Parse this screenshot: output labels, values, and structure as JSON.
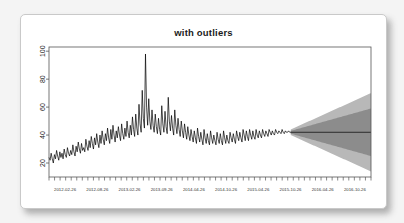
{
  "card": {
    "background": "#ffffff",
    "page_background": "#f4f4f4"
  },
  "chart_data": {
    "type": "line",
    "title": "with outliers",
    "xlabel": "",
    "ylabel": "",
    "ylim": [
      10,
      103
    ],
    "yticks": [
      20,
      40,
      60,
      80,
      100
    ],
    "ytick_labels": [
      "20",
      "40",
      "60",
      "80",
      "100"
    ],
    "grid": false,
    "legend": null,
    "xtick_labels": [
      "2012-02-26",
      "2012-08-26",
      "2013-02-26",
      "2013-09-26",
      "2014-04-26",
      "2014-10-26",
      "2015-04-26",
      "2015-10-26",
      "2016-04-26",
      "2016-10-26"
    ],
    "xtick_minor_count": 58,
    "series": [
      {
        "name": "observed",
        "color": "#000000",
        "x_start": "2012-02-26",
        "x_end": "2015-11-26",
        "values": [
          24,
          22,
          27,
          23,
          20,
          26,
          23,
          29,
          25,
          22,
          28,
          24,
          27,
          23,
          30,
          26,
          24,
          31,
          27,
          25,
          29,
          26,
          33,
          28,
          25,
          32,
          28,
          35,
          30,
          27,
          34,
          29,
          31,
          28,
          37,
          32,
          29,
          36,
          31,
          39,
          34,
          30,
          38,
          33,
          41,
          35,
          31,
          40,
          34,
          43,
          37,
          33,
          41,
          36,
          45,
          38,
          34,
          44,
          37,
          47,
          40,
          35,
          43,
          38,
          46,
          40,
          36,
          48,
          41,
          37,
          45,
          39,
          50,
          42,
          38,
          47,
          40,
          53,
          44,
          39,
          55,
          45,
          40,
          62,
          48,
          42,
          72,
          52,
          45,
          98,
          60,
          47,
          66,
          50,
          44,
          58,
          47,
          42,
          55,
          46,
          41,
          52,
          44,
          40,
          61,
          48,
          42,
          57,
          46,
          41,
          67,
          50,
          43,
          54,
          45,
          40,
          58,
          47,
          41,
          52,
          44,
          39,
          50,
          43,
          38,
          48,
          42,
          37,
          46,
          40,
          36,
          44,
          39,
          35,
          43,
          38,
          34,
          45,
          39,
          35,
          42,
          37,
          33,
          44,
          38,
          34,
          41,
          36,
          33,
          43,
          38,
          34,
          40,
          36,
          33,
          42,
          37,
          34,
          41,
          36,
          33,
          43,
          38,
          34,
          40,
          36,
          34,
          42,
          38,
          35,
          41,
          37,
          34,
          43,
          39,
          36,
          42,
          38,
          35,
          44,
          40,
          36,
          43,
          39,
          36,
          44,
          40,
          37,
          43,
          39,
          37,
          44,
          40,
          38,
          43,
          40,
          38,
          44,
          41,
          39,
          43,
          41,
          39,
          44,
          42,
          40,
          43,
          41,
          40,
          44,
          42,
          41,
          43,
          42,
          41,
          44,
          42,
          41,
          43,
          42,
          42,
          43,
          42,
          42
        ]
      }
    ],
    "forecast": {
      "name": "forecast",
      "x_start": "2015-11-26",
      "x_end": "2017-01-26",
      "mean": 42,
      "mean_color": "#2b2b2b",
      "bands": [
        {
          "name": "95%",
          "color": "#b8b8b8",
          "start_lower": 40,
          "start_upper": 44,
          "end_lower": 14,
          "end_upper": 70
        },
        {
          "name": "80%",
          "color": "#8c8c8c",
          "start_lower": 41,
          "start_upper": 43,
          "end_lower": 25,
          "end_upper": 59
        }
      ]
    }
  }
}
